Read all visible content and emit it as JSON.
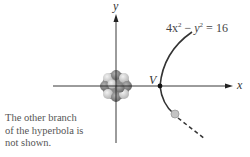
{
  "diagram": {
    "axis_labels": {
      "x": "x",
      "y": "y"
    },
    "vertex_label": "V",
    "equation": {
      "lhs_1": "4x",
      "exp_1": "2",
      "minus": " − ",
      "lhs_2": "y",
      "exp_2": "2",
      "rhs": " = 16"
    },
    "caption": {
      "line1": "The other branch",
      "line2": "of the hyperbola is",
      "line3": "not shown."
    },
    "colors": {
      "axis": "#222222",
      "curve": "#333333",
      "nucleus_dark": "#7a7a7a",
      "nucleus_light": "#c8c8c8",
      "particle": "#bdbdbd"
    }
  }
}
